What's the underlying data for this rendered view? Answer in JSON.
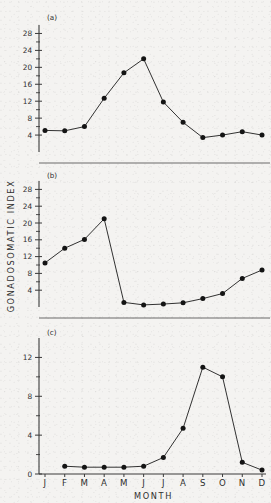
{
  "figure": {
    "axis_title_y": "GONADOSOMATIC INDEX",
    "axis_title_x": "MONTH",
    "month_labels": [
      "J",
      "F",
      "M",
      "A",
      "M",
      "J",
      "J",
      "A",
      "S",
      "O",
      "N",
      "D"
    ],
    "panel_labels": {
      "a": "(a)",
      "b": "(b)",
      "c": "(c)"
    },
    "colors": {
      "ink": "#1c1c1c",
      "axis": "#3a3a3a",
      "separator": "#6a6a6a",
      "paper": "#f4f3f1"
    }
  },
  "chart_data": [
    {
      "type": "line",
      "panel": "(a)",
      "title": "",
      "xlabel": "MONTH",
      "ylabel": "GONADOSOMATIC INDEX",
      "categories": [
        "J",
        "F",
        "M",
        "A",
        "M",
        "J",
        "J",
        "A",
        "S",
        "O",
        "N",
        "D"
      ],
      "values": [
        5.1,
        5.0,
        6.0,
        12.7,
        18.7,
        22.0,
        11.8,
        7.0,
        3.4,
        4.0,
        4.8,
        4.0
      ],
      "ytick_labels": [
        4,
        8,
        12,
        16,
        20,
        24,
        28
      ],
      "ylim": [
        0,
        30
      ],
      "grid": false,
      "legend": "none",
      "markers": "filled-circle"
    },
    {
      "type": "line",
      "panel": "(b)",
      "title": "",
      "xlabel": "MONTH",
      "ylabel": "GONADOSOMATIC INDEX",
      "categories": [
        "J",
        "F",
        "M",
        "A",
        "M",
        "J",
        "J",
        "A",
        "S",
        "O",
        "N",
        "D"
      ],
      "values": [
        10.5,
        14.0,
        16.1,
        21.0,
        1.1,
        0.5,
        0.7,
        1.0,
        2.0,
        3.2,
        6.8,
        8.8
      ],
      "ytick_labels": [
        4,
        8,
        12,
        16,
        20,
        24,
        28
      ],
      "ylim": [
        0,
        30
      ],
      "grid": false,
      "legend": "none",
      "markers": "filled-circle"
    },
    {
      "type": "line",
      "panel": "(c)",
      "title": "",
      "xlabel": "MONTH",
      "ylabel": "GONADOSOMATIC INDEX",
      "categories": [
        "J",
        "F",
        "M",
        "A",
        "M",
        "J",
        "J",
        "A",
        "S",
        "O",
        "N",
        "D"
      ],
      "values": [
        null,
        0.8,
        0.7,
        0.7,
        0.7,
        0.8,
        1.7,
        4.7,
        11.0,
        10.0,
        1.2,
        0.4
      ],
      "ytick_labels": [
        0,
        4,
        8,
        12
      ],
      "ylim": [
        0,
        14
      ],
      "grid": false,
      "legend": "none",
      "markers": "filled-circle"
    }
  ]
}
